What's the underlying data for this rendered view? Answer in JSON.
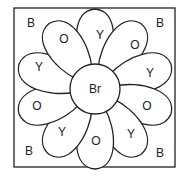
{
  "diagram": {
    "type": "color-by-letter flower",
    "center": {
      "label": "Br",
      "cx": 95,
      "cy": 89,
      "r": 25
    },
    "corners": [
      {
        "pos": "top-left",
        "label": "B",
        "x": 31,
        "y": 23
      },
      {
        "pos": "top-right",
        "label": "B",
        "x": 160,
        "y": 23
      },
      {
        "pos": "bottom-left",
        "label": "B",
        "x": 29,
        "y": 151
      },
      {
        "pos": "bottom-right",
        "label": "B",
        "x": 160,
        "y": 153
      }
    ],
    "petals": [
      {
        "label": "Y",
        "angle": -90,
        "lx": 100,
        "ly": 35
      },
      {
        "label": "O",
        "angle": -55,
        "lx": 135,
        "ly": 45
      },
      {
        "label": "Y",
        "angle": -18,
        "lx": 150,
        "ly": 73
      },
      {
        "label": "O",
        "angle": 18,
        "lx": 147,
        "ly": 106
      },
      {
        "label": "Y",
        "angle": 55,
        "lx": 131,
        "ly": 134
      },
      {
        "label": "O",
        "angle": 90,
        "lx": 96,
        "ly": 141
      },
      {
        "label": "Y",
        "angle": 125,
        "lx": 62,
        "ly": 132
      },
      {
        "label": "O",
        "angle": 162,
        "lx": 37,
        "ly": 106
      },
      {
        "label": "Y",
        "angle": 198,
        "lx": 39,
        "ly": 67
      },
      {
        "label": "O",
        "angle": 235,
        "lx": 64,
        "ly": 39
      }
    ]
  }
}
